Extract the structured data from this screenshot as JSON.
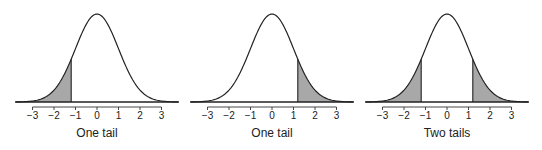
{
  "chart_data": [
    {
      "type": "area",
      "title": "",
      "caption": "One tail",
      "distribution": "standard normal",
      "xlabel": "",
      "ylabel": "",
      "xlim": [
        -3.8,
        3.8
      ],
      "x_ticks": [
        -3,
        -2,
        -1,
        0,
        1,
        2,
        3
      ],
      "x_tick_labels": [
        "−3",
        "−2",
        "−1",
        "0",
        "1",
        "2",
        "3"
      ],
      "shaded_regions": [
        {
          "from": -3.8,
          "to": -1.2
        }
      ],
      "cutoffs": [
        -1.2
      ],
      "grid": false
    },
    {
      "type": "area",
      "title": "",
      "caption": "One tail",
      "distribution": "standard normal",
      "xlabel": "",
      "ylabel": "",
      "xlim": [
        -3.8,
        3.8
      ],
      "x_ticks": [
        -3,
        -2,
        -1,
        0,
        1,
        2,
        3
      ],
      "x_tick_labels": [
        "−3",
        "−2",
        "−1",
        "0",
        "1",
        "2",
        "3"
      ],
      "shaded_regions": [
        {
          "from": 1.2,
          "to": 3.8
        }
      ],
      "cutoffs": [
        1.2
      ],
      "grid": false
    },
    {
      "type": "area",
      "title": "",
      "caption": "Two tails",
      "distribution": "standard normal",
      "xlabel": "",
      "ylabel": "",
      "xlim": [
        -3.8,
        3.8
      ],
      "x_ticks": [
        -3,
        -2,
        -1,
        0,
        1,
        2,
        3
      ],
      "x_tick_labels": [
        "−3",
        "−2",
        "−1",
        "0",
        "1",
        "2",
        "3"
      ],
      "shaded_regions": [
        {
          "from": -3.8,
          "to": -1.2
        },
        {
          "from": 1.2,
          "to": 3.8
        }
      ],
      "cutoffs": [
        -1.2,
        1.2
      ],
      "grid": false
    }
  ],
  "layout": {
    "panels": [
      {
        "center_x": 97,
        "unit_px": 21.5
      },
      {
        "center_x": 272,
        "unit_px": 21.5
      },
      {
        "center_x": 447,
        "unit_px": 21.5
      }
    ],
    "baseline_y": 102,
    "peak_height_px": 88,
    "tick_y": 107,
    "tick_label_y": 119,
    "caption_y": 137,
    "colors": {
      "curve": "#222222",
      "shade": "#a8a8a8",
      "axis": "#333333",
      "text": "#222222"
    }
  }
}
